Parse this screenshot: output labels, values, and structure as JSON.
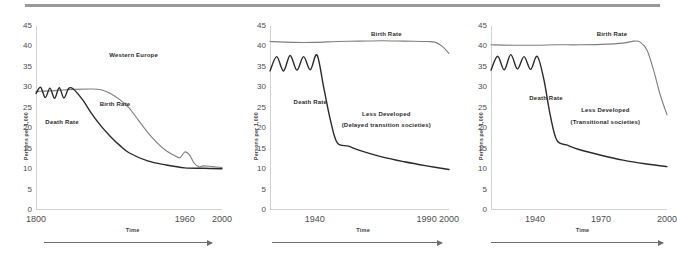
{
  "figure": {
    "y_axis_label": "Persons per 1,000",
    "x_axis_label": "Time",
    "y_ticks": [
      "45",
      "40",
      "35",
      "30",
      "25",
      "20",
      "15",
      "10",
      "5",
      "0"
    ],
    "series_labels": {
      "birth": "Birth Rate",
      "death": "Death Rate"
    }
  },
  "chart_data": [
    {
      "type": "line",
      "title": "Western Europe",
      "subtitle": "",
      "xlabel": "Time",
      "ylabel": "Persons per 1,000",
      "ylim": [
        0,
        45
      ],
      "xlim": [
        1800,
        2000
      ],
      "x_ticks": [
        "1800",
        "1960",
        "2000"
      ],
      "x_tick_values": [
        1800,
        1960,
        2000
      ],
      "grid": false,
      "legend": "inline-labels",
      "series": [
        {
          "name": "Birth Rate",
          "color": "#7f7f7f",
          "x": [
            1800,
            1820,
            1840,
            1860,
            1870,
            1880,
            1890,
            1900,
            1910,
            1920,
            1930,
            1940,
            1950,
            1955,
            1960,
            1965,
            1970,
            1975,
            1980,
            1990,
            2000
          ],
          "values": [
            29,
            29.2,
            29.5,
            29.6,
            29.4,
            28.5,
            27,
            25,
            22,
            19,
            16.5,
            14.5,
            13.2,
            12.8,
            14.2,
            13.5,
            11.5,
            10.6,
            10.8,
            10.6,
            10.4
          ]
        },
        {
          "name": "Death Rate",
          "color": "#2b2b2b",
          "x": [
            1800,
            1805,
            1810,
            1815,
            1820,
            1825,
            1830,
            1835,
            1840,
            1850,
            1860,
            1870,
            1880,
            1890,
            1900,
            1920,
            1940,
            1960,
            1980,
            2000
          ],
          "values": [
            28.5,
            30,
            27.5,
            29.8,
            27.3,
            29.9,
            27.4,
            29.7,
            29.6,
            27,
            23.5,
            20.5,
            18,
            15.8,
            14,
            12,
            11,
            10.3,
            10.2,
            10.1
          ]
        }
      ],
      "annotations": [
        {
          "text": "Western Europe",
          "x": 1905,
          "y": 38
        },
        {
          "text": "Birth Rate",
          "x": 1885,
          "y": 26
        },
        {
          "text": "Death Rate",
          "x": 1828,
          "y": 21.5
        }
      ]
    },
    {
      "type": "line",
      "title": "Less Developed",
      "subtitle": "(Delayed transition societies)",
      "xlabel": "Time",
      "ylabel": "Persons per 1,000",
      "ylim": [
        0,
        45
      ],
      "xlim": [
        1920,
        2000
      ],
      "x_ticks": [
        "1940",
        "1990",
        "2000"
      ],
      "x_tick_values": [
        1940,
        1990,
        2000
      ],
      "grid": false,
      "legend": "inline-labels",
      "series": [
        {
          "name": "Birth Rate",
          "color": "#7f7f7f",
          "x": [
            1920,
            1930,
            1940,
            1950,
            1960,
            1970,
            1980,
            1990,
            1994,
            1997,
            2000
          ],
          "values": [
            41.2,
            41,
            41,
            41.2,
            41.3,
            41.4,
            41.3,
            41.2,
            41,
            40,
            38.3
          ]
        },
        {
          "name": "Death Rate",
          "color": "#2b2b2b",
          "x": [
            1920,
            1923,
            1926,
            1929,
            1932,
            1935,
            1938,
            1941,
            1944,
            1947,
            1950,
            1955,
            1960,
            1970,
            1980,
            1990,
            2000
          ],
          "values": [
            34,
            37.5,
            34,
            37.8,
            34.2,
            37.5,
            34.3,
            37.9,
            30,
            22,
            16.5,
            15.6,
            14.6,
            13,
            11.8,
            10.8,
            9.9
          ]
        }
      ],
      "annotations": [
        {
          "text": "Birth Rate",
          "x": 1972,
          "y": 43
        },
        {
          "text": "Death Rate",
          "x": 1938,
          "y": 26.5
        },
        {
          "text": "Less Developed",
          "x": 1972,
          "y": 23.5
        },
        {
          "text": "(Delayed transition societies)",
          "x": 1972,
          "y": 20.8
        }
      ]
    },
    {
      "type": "line",
      "title": "Less Developed",
      "subtitle": "(Transitional  societies)",
      "xlabel": "Time",
      "ylabel": "Persons per 1,000",
      "ylim": [
        0,
        45
      ],
      "xlim": [
        1920,
        2000
      ],
      "x_ticks": [
        "1940",
        "1970",
        "2000"
      ],
      "x_tick_values": [
        1940,
        1970,
        2000
      ],
      "grid": false,
      "legend": "inline-labels",
      "series": [
        {
          "name": "Birth Rate",
          "color": "#7f7f7f",
          "x": [
            1920,
            1930,
            1940,
            1950,
            1960,
            1970,
            1980,
            1985,
            1988,
            1991,
            1994,
            1997,
            2000
          ],
          "values": [
            40.4,
            40.3,
            40.3,
            40.4,
            40.4,
            40.5,
            40.8,
            41.3,
            41,
            39,
            34,
            28,
            23.3
          ]
        },
        {
          "name": "Death Rate",
          "color": "#2b2b2b",
          "x": [
            1920,
            1923,
            1926,
            1929,
            1932,
            1935,
            1938,
            1941,
            1944,
            1947,
            1950,
            1955,
            1960,
            1970,
            1980,
            1990,
            2000
          ],
          "values": [
            34.2,
            37.6,
            34.3,
            38,
            34.5,
            37.5,
            34.4,
            37.6,
            32,
            23,
            17,
            15.8,
            14.8,
            13.4,
            12.2,
            11.3,
            10.6
          ]
        }
      ],
      "annotations": [
        {
          "text": "Birth Rate",
          "x": 1975,
          "y": 43
        },
        {
          "text": "Death Rate",
          "x": 1945,
          "y": 27.5
        },
        {
          "text": "Less Developed",
          "x": 1972,
          "y": 24.5
        },
        {
          "text": "(Transitional  societies)",
          "x": 1972,
          "y": 21.5
        }
      ]
    }
  ]
}
